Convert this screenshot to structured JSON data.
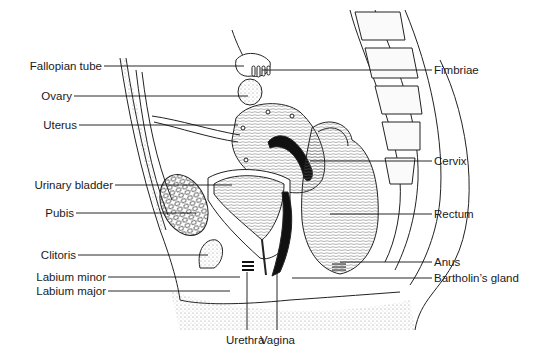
{
  "diagram": {
    "labels_left": [
      {
        "id": "fallopian-tube",
        "text": "Fallopian tube",
        "y": 66
      },
      {
        "id": "ovary",
        "text": "Ovary",
        "y": 96
      },
      {
        "id": "uterus",
        "text": "Uterus",
        "y": 125
      },
      {
        "id": "urinary-bladder",
        "text": "Urinary bladder",
        "y": 185
      },
      {
        "id": "pubis",
        "text": "Pubis",
        "y": 213
      },
      {
        "id": "clitoris",
        "text": "Clitoris",
        "y": 255
      },
      {
        "id": "labium-minor",
        "text": "Labium minor",
        "y": 277
      },
      {
        "id": "labium-major",
        "text": "Labium major",
        "y": 291
      }
    ],
    "labels_right": [
      {
        "id": "fimbriae",
        "text": "Fimbriae",
        "y": 70
      },
      {
        "id": "cervix",
        "text": "Cervix",
        "y": 161
      },
      {
        "id": "rectum",
        "text": "Rectum",
        "y": 214
      },
      {
        "id": "anus",
        "text": "Anus",
        "y": 262
      },
      {
        "id": "bartholins-gland",
        "text": "Bartholin’s gland",
        "y": 278
      }
    ],
    "labels_bottom": [
      {
        "id": "urethra",
        "text": "Urethra",
        "x": 247
      },
      {
        "id": "vagina",
        "text": "Vagina",
        "x": 277
      }
    ]
  }
}
